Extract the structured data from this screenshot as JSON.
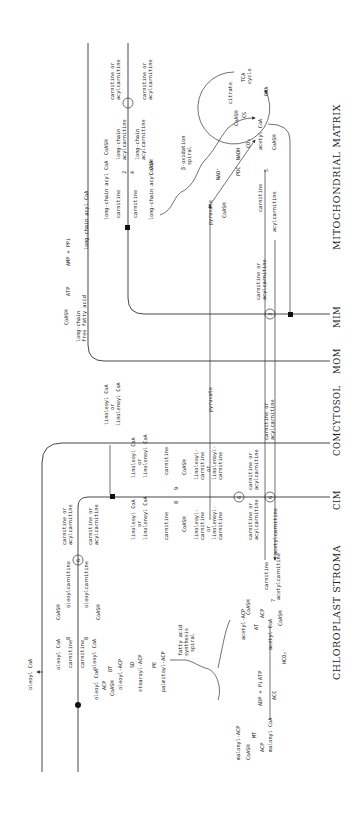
{
  "compartments": {
    "mitochondrial_matrix": "MITOCHONDRIAL MATRIX",
    "mim": "MIM",
    "mom": "MOM",
    "cytosol": "CYTOSOL",
    "com": "COM",
    "cim": "CIM",
    "chloroplast_stroma": "CHLOROPLAST STROMA"
  },
  "mitochondria": {
    "carn_or_acyl_top_out": [
      "carnitine or",
      "acylcarnitine"
    ],
    "carn_or_acyl_top_in": [
      "carnitine or",
      "acylcarnitine"
    ],
    "lc_acylcarnitine_out": [
      "long-chain",
      "acylcarnitine"
    ],
    "lc_acylcarnitine_in": [
      "long-chain",
      "acylcarnitine"
    ],
    "coash_1": "CoASH",
    "coash_2": "CoASH",
    "enzyme_2": "2",
    "enzyme_4": "4",
    "lc_acyl_coa_1": "long-chain acyl CoA",
    "carnitine_1": "carnitine",
    "carnitine_2": "carnitine",
    "lc_acyl_coa_2": "long-chain acyl CoA",
    "lc_acyl_coa_3": "long-chain acyl CoA",
    "atp": "ATP",
    "amp_ppi": "AMP + PPi",
    "coash_ffa": "CoASH",
    "lc_ffa": [
      "long-chain",
      "free fatty acid"
    ],
    "beta_oxidation": [
      "β-oxidation",
      "spiral"
    ],
    "tca": [
      "TCA",
      "cycle"
    ],
    "citrate": "citrate",
    "cs": "CS",
    "oaa": "OAA",
    "coash_cs": "CoASH",
    "acetyl_coa": "acetyl CoA",
    "nadh": "NADH",
    "co2": "CO₂",
    "nad": "NAD⁺",
    "pdc": "PDC",
    "coash_pdc": "CoASH",
    "pyruvate_in": "pyruvate",
    "enzyme_5": "5",
    "coash_5": "CoASH",
    "carnitine_5": "carnitine",
    "acylcarnitine_5": "acylcarnitine",
    "carn_or_acyl_mim": [
      "carnitine or",
      "acylcarnitine"
    ],
    "enzyme_3": "3"
  },
  "cytosol": {
    "pyruvate": "pyruvate",
    "linoleoyl_or_linolenoyl": [
      "linoleoyl CoA",
      "or",
      "linolenoyl CoA"
    ]
  },
  "chloroplast": {
    "linoleoyl_or_linolenoyl_in": [
      "linoleoyl CoA",
      "or",
      "linolenoyl CoA"
    ],
    "linoleoyl_or_linolenoyl_in2": [
      "linoleoyl CoA",
      "or",
      "linolenoyl CoA"
    ],
    "carnitine_9": "carnitine",
    "coash_9": "CoASH",
    "enzyme_9": "9",
    "enzyme_8": "8",
    "carnitine_8": "carnitine",
    "coash_8": "CoASH",
    "linoleoyl_carn_1": [
      "linoleoyl-",
      "carnitine",
      "or",
      "linolenoyl-",
      "carnitine"
    ],
    "linoleoyl_carn_2": [
      "linoleoyl-",
      "carnitine",
      "or",
      "linolenoyl-",
      "carnitine"
    ],
    "enzyme_6_top": "6",
    "enzyme_6_cim": "6",
    "carn_or_acyl_6a": [
      "carnitine or",
      "acylcarnitine"
    ],
    "carn_or_acyl_6b": [
      "carnitine or",
      "acylcarnitine"
    ],
    "carn_or_acyl_6c": [
      "carnitine or",
      "acylcarnitine"
    ],
    "carn_or_acyl_left": [
      "carnitine or",
      "acylcarnitine"
    ],
    "carn_or_acyl_left2": [
      "carnitine or",
      "acylcarnitine"
    ],
    "enzyme_6_left": "6",
    "oleoylcarnitine_1": "oleoylcarnitine",
    "oleoylcarnitine_2": "oleoylcarnitine",
    "coash_o1": "CoASH",
    "coash_o2": "CoASH",
    "enzyme_8b": "8",
    "enzyme_8c": "8",
    "oleoyl_coa_1": "oleoyl CoA",
    "carnitine_o1": "carnitine",
    "carnitine_o2": "carnitine",
    "oleoyl_coa_2": "oleoyl CoA",
    "oleoyl_coa_out": "oleoyl CoA",
    "oleoyl_coa_3": "oleoyl CoA",
    "acp": "ACP",
    "coash_ot": "CoASH",
    "ot": "OT",
    "oleoyl_acp": "oleoyl-ACP",
    "sd": "SD",
    "stearoyl_acp": "stearoyl-ACP",
    "pe": "PE",
    "palmitoyl_acp": "palmitoyl-ACP",
    "fas_spiral": [
      "fatty acid",
      "synthesis",
      "spiral"
    ],
    "acetyl_acp": "acetyl-ACP",
    "coash_at": "CoASH",
    "at": "AT",
    "acp_at": "ACP",
    "acetyl_coa": "acetyl CoA",
    "enzyme_7": "7",
    "coash_7": "CoASH",
    "carnitine_7": "carnitine",
    "acetylcarnitine": "acetylcarnitine",
    "acetylcarnitine_out": "acetylcarnitine",
    "atp": "ATP",
    "adp_pi": "ADP + Pi",
    "acc": "ACC",
    "hco3": "HCO₃⁻",
    "malonyl_coa": "malonyl CoA",
    "malonyl_acp": "malonyl-ACP",
    "mt": "MT",
    "acp_mt": "ACP",
    "coash_mt": "CoASH"
  }
}
